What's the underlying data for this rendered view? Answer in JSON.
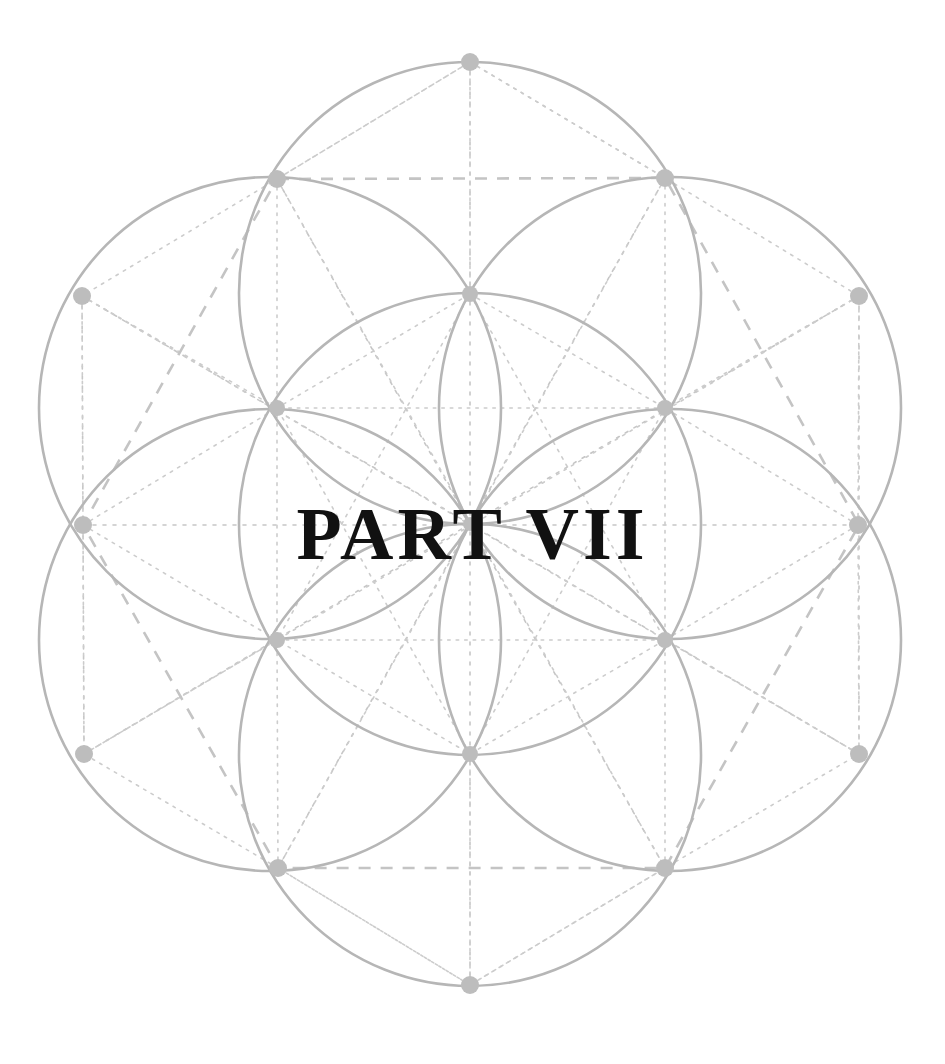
{
  "page": {
    "title": "PART VII",
    "background_color": "#ffffff",
    "width": 945,
    "height": 1064
  },
  "title_block": {
    "label": "PART VII",
    "part_word": "PART",
    "part_number_roman": "VII",
    "part_number": 7,
    "color": "#111111"
  },
  "ornament": {
    "name": "seed-of-life-geometric-ornament",
    "style": "sacred-geometry",
    "circle_stroke_color": "#b9b9b9",
    "guide_stroke_color": "#c9c9c9",
    "node_fill_color": "#bdbdbd",
    "circle_radius": 231,
    "center": {
      "x": 470,
      "y": 524
    },
    "circle_centers": [
      {
        "name": "center",
        "x": 470,
        "y": 524
      },
      {
        "name": "upper",
        "x": 470,
        "y": 293
      },
      {
        "name": "upper-right",
        "x": 670,
        "y": 408
      },
      {
        "name": "lower-right",
        "x": 670,
        "y": 640
      },
      {
        "name": "lower",
        "x": 470,
        "y": 755
      },
      {
        "name": "lower-left",
        "x": 270,
        "y": 640
      },
      {
        "name": "upper-left",
        "x": 270,
        "y": 408
      }
    ],
    "outer_nodes": [
      {
        "x": 470,
        "y": 62
      },
      {
        "x": 665,
        "y": 178
      },
      {
        "x": 859,
        "y": 296
      },
      {
        "x": 858,
        "y": 525
      },
      {
        "x": 859,
        "y": 754
      },
      {
        "x": 665,
        "y": 868
      },
      {
        "x": 470,
        "y": 985
      },
      {
        "x": 278,
        "y": 868
      },
      {
        "x": 84,
        "y": 754
      },
      {
        "x": 83,
        "y": 525
      },
      {
        "x": 82,
        "y": 296
      },
      {
        "x": 277,
        "y": 179
      }
    ],
    "inner_nodes": [
      {
        "x": 470,
        "y": 294
      },
      {
        "x": 665,
        "y": 408
      },
      {
        "x": 665,
        "y": 640
      },
      {
        "x": 470,
        "y": 754
      },
      {
        "x": 277,
        "y": 640
      },
      {
        "x": 277,
        "y": 408
      }
    ],
    "node_radius_outer": 9,
    "node_radius_inner": 8,
    "guides": {
      "dashed_hexagon": "outer nodes connected",
      "dotted_radials": "center to every node",
      "dotted_axes": "horizontal and vertical through center"
    }
  }
}
